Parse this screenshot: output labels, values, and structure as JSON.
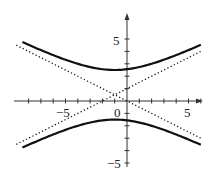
{
  "chart_data": {
    "type": "line",
    "title": "",
    "xlabel": "",
    "ylabel": "",
    "xlim": [
      -9,
      6.5
    ],
    "ylim": [
      -5.2,
      6
    ],
    "grid": false,
    "x_ticks": [
      -8,
      -7,
      -6,
      -5,
      -4,
      -3,
      -2,
      -1,
      0,
      1,
      2,
      3,
      4,
      5,
      6
    ],
    "y_ticks": [
      -5,
      -4,
      -3,
      -2,
      -1,
      1,
      2,
      3,
      4,
      5
    ],
    "x_tick_labels": [
      {
        "value": -5,
        "label": "−5"
      },
      {
        "value": 0,
        "label": "0"
      },
      {
        "value": 5,
        "label": "5"
      }
    ],
    "y_tick_labels": [
      {
        "value": 5,
        "label": "5"
      },
      {
        "value": -5,
        "label": "−5"
      }
    ],
    "series": [
      {
        "name": "hyperbola upper branch",
        "style": "solid",
        "equation": "(y-0.5)^2/4 - (x+1)^2/16 = 1, upper",
        "x_range": [
          -8.5,
          6
        ]
      },
      {
        "name": "hyperbola lower branch",
        "style": "solid",
        "equation": "(y-0.5)^2/4 - (x+1)^2/16 = 1, lower",
        "x_range": [
          -8.5,
          6
        ]
      },
      {
        "name": "asymptote 1",
        "style": "dotted",
        "equation": "y = 0.5 + 0.5(x+1)",
        "x_range": [
          -9,
          6
        ]
      },
      {
        "name": "asymptote 2",
        "style": "dotted",
        "equation": "y = 0.5 - 0.5(x+1)",
        "x_range": [
          -9,
          6
        ]
      }
    ],
    "center": {
      "x": -1,
      "y": 0.5
    },
    "a": 2,
    "b": 4
  },
  "labels": {
    "x_neg5": "−5",
    "x_0": "0",
    "x_5": "5",
    "y_5": "5",
    "y_neg5": "−5"
  }
}
